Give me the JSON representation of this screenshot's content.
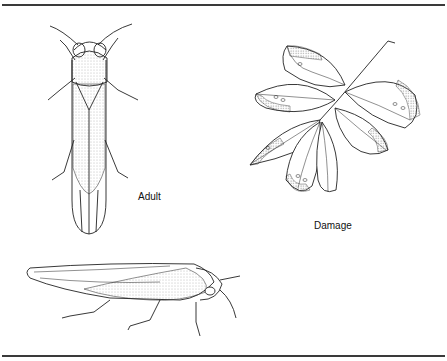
{
  "figure": {
    "labels": {
      "adult": "Adult",
      "damage": "Damage"
    },
    "panels": [
      {
        "id": "adult-dorsal",
        "description": "adult leafhopper, dorsal view"
      },
      {
        "id": "leaf-damage",
        "description": "leaf cluster showing marginal damage"
      },
      {
        "id": "adult-lateral",
        "description": "adult leafhopper, lateral view"
      }
    ],
    "colors": {
      "line": "#222222",
      "stipple": "#8a8a8a",
      "rule": "#3a3a3a",
      "background": "#ffffff"
    }
  }
}
